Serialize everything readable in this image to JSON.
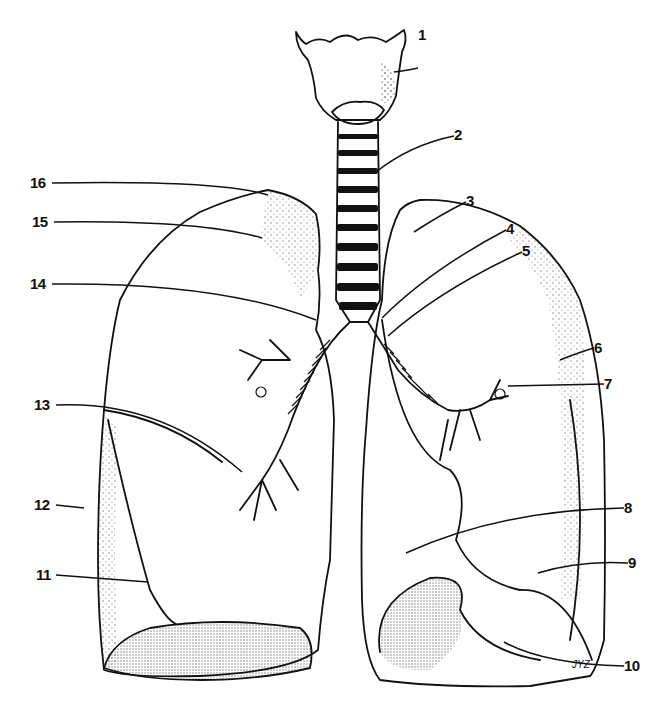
{
  "figure": {
    "signature": "JYZ"
  },
  "labels": [
    {
      "id": 1,
      "text": "1",
      "x": 418,
      "y": 36
    },
    {
      "id": 2,
      "text": "2",
      "x": 454,
      "y": 130
    },
    {
      "id": 3,
      "text": "3",
      "x": 466,
      "y": 195
    },
    {
      "id": 4,
      "text": "4",
      "x": 506,
      "y": 222
    },
    {
      "id": 5,
      "text": "5",
      "x": 522,
      "y": 244
    },
    {
      "id": 6,
      "text": "6",
      "x": 594,
      "y": 340
    },
    {
      "id": 7,
      "text": "7",
      "x": 604,
      "y": 376
    },
    {
      "id": 8,
      "text": "8",
      "x": 624,
      "y": 501
    },
    {
      "id": 9,
      "text": "9",
      "x": 628,
      "y": 556
    },
    {
      "id": 10,
      "text": "10",
      "x": 624,
      "y": 659
    },
    {
      "id": 11,
      "text": "11",
      "x": 36,
      "y": 568
    },
    {
      "id": 12,
      "text": "12",
      "x": 34,
      "y": 498
    },
    {
      "id": 13,
      "text": "13",
      "x": 34,
      "y": 398
    },
    {
      "id": 14,
      "text": "14",
      "x": 30,
      "y": 277
    },
    {
      "id": 15,
      "text": "15",
      "x": 32,
      "y": 215
    },
    {
      "id": 16,
      "text": "16",
      "x": 30,
      "y": 176
    }
  ]
}
